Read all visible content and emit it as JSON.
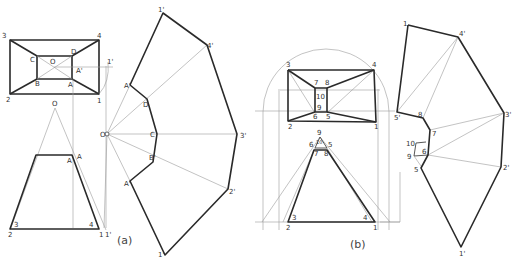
{
  "figure_a": {
    "caption": "(a)",
    "plan_view": {
      "outer_labels": [
        "1",
        "2",
        "3",
        "4"
      ],
      "inner_labels": [
        "A",
        "B",
        "C",
        "D"
      ],
      "center_label": "O",
      "projected_label": "A'",
      "aux_label": "1'"
    },
    "elevation_view": {
      "apex_label": "O",
      "top_labels": [
        "A",
        "A"
      ],
      "bottom_labels": [
        "2",
        "3",
        "4",
        "1",
        "1'"
      ]
    },
    "development": {
      "center_label": "O",
      "outer_labels": [
        "1'",
        "4'",
        "3'",
        "2'",
        "1'"
      ],
      "inner_labels": [
        "A'",
        "D",
        "C",
        "B'",
        "A'"
      ]
    }
  },
  "figure_b": {
    "caption": "(b)",
    "plan_view": {
      "outer_labels": [
        "1",
        "2",
        "3",
        "4"
      ],
      "inner_labels": [
        "5",
        "6",
        "7",
        "8",
        "9",
        "10"
      ]
    },
    "elevation_view": {
      "apex_label": "9",
      "top_labels": [
        "6",
        "5",
        "7",
        "8",
        "10"
      ],
      "bottom_labels": [
        "2",
        "3",
        "4",
        "1"
      ]
    },
    "development": {
      "outer_labels": [
        "1",
        "4'",
        "3'",
        "2'",
        "1'",
        "5'"
      ],
      "inner_labels": [
        "8",
        "7",
        "6",
        "5",
        "9",
        "10"
      ]
    }
  }
}
